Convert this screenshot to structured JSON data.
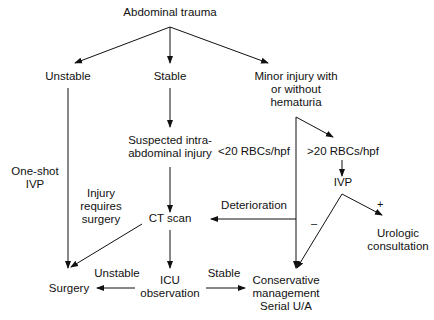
{
  "diagram": {
    "title": "Abdominal trauma",
    "nodes": {
      "root": "Abdominal trauma",
      "unstable": "Unstable",
      "stable": "Stable",
      "minor_l1": "Minor injury with",
      "minor_l2": "or without",
      "minor_l3": "hematuria",
      "suspected_l1": "Suspected intra-",
      "suspected_l2": "abdominal injury",
      "gt20": ">20 RBCs/hpf",
      "ivp": "IVP",
      "ct": "CT scan",
      "urologic_l1": "Urologic",
      "urologic_l2": "consultation",
      "icu_l1": "ICU",
      "icu_l2": "observation",
      "surgery": "Surgery",
      "conservative_l1": "Conservative",
      "conservative_l2": "management",
      "conservative_l3": "Serial U/A"
    },
    "edge_labels": {
      "lt20": "<20 RBCs/hpf",
      "oneshot_l1": "One-shot",
      "oneshot_l2": "IVP",
      "injury_l1": "Injury",
      "injury_l2": "requires",
      "injury_l3": "surgery",
      "deterioration": "Deterioration",
      "plus": "+",
      "minus": "–",
      "icu_unstable": "Unstable",
      "icu_stable": "Stable"
    },
    "edges": [
      {
        "from": "Abdominal trauma",
        "to": "Unstable"
      },
      {
        "from": "Abdominal trauma",
        "to": "Stable"
      },
      {
        "from": "Abdominal trauma",
        "to": "Minor injury with or without hematuria"
      },
      {
        "from": "Unstable",
        "to": "Surgery",
        "label": "One-shot IVP"
      },
      {
        "from": "Stable",
        "to": "Suspected intra-abdominal injury"
      },
      {
        "from": "Suspected intra-abdominal injury",
        "to": "CT scan"
      },
      {
        "from": "Minor injury with or without hematuria",
        "to": "Conservative management Serial U/A",
        "label": "<20 RBCs/hpf"
      },
      {
        "from": "Minor injury with or without hematuria",
        "to": ">20 RBCs/hpf"
      },
      {
        "from": ">20 RBCs/hpf",
        "to": "IVP"
      },
      {
        "from": "IVP",
        "to": "Urologic consultation",
        "label": "+"
      },
      {
        "from": "IVP",
        "to": "Conservative management Serial U/A",
        "label": "–"
      },
      {
        "from": "Conservative management Serial U/A",
        "to": "CT scan",
        "label": "Deterioration"
      },
      {
        "from": "CT scan",
        "to": "Surgery",
        "label": "Injury requires surgery"
      },
      {
        "from": "CT scan",
        "to": "ICU observation"
      },
      {
        "from": "ICU observation",
        "to": "Surgery",
        "label": "Unstable"
      },
      {
        "from": "ICU observation",
        "to": "Conservative management Serial U/A",
        "label": "Stable"
      }
    ]
  }
}
